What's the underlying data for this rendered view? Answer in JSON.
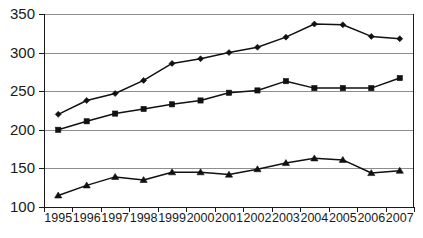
{
  "chart_data": {
    "type": "line",
    "title": "",
    "subtitle": "",
    "xlabel": "",
    "ylabel": "",
    "categories": [
      "1995",
      "1996",
      "1997",
      "1998",
      "1999",
      "2000",
      "2001",
      "2002",
      "2003",
      "2004",
      "2005",
      "2006",
      "2007"
    ],
    "x": [
      1995,
      1996,
      1997,
      1998,
      1999,
      2000,
      2001,
      2002,
      2003,
      2004,
      2005,
      2006,
      2007
    ],
    "ylim": [
      100,
      350
    ],
    "yticks": [
      100,
      150,
      200,
      250,
      300,
      350
    ],
    "ytick_labels": [
      "100",
      "150",
      "200",
      "250",
      "300",
      "350"
    ],
    "grid": true,
    "grid_axis": "y",
    "legend": false,
    "legend_position": "none",
    "series": [
      {
        "name": "series-1",
        "marker": "diamond",
        "color": "#111111",
        "values": [
          220,
          238,
          247,
          264,
          286,
          292,
          300,
          307,
          320,
          337,
          336,
          321,
          318
        ]
      },
      {
        "name": "series-2",
        "marker": "square",
        "color": "#111111",
        "values": [
          200,
          211,
          221,
          227,
          233,
          238,
          248,
          251,
          263,
          254,
          254,
          254,
          267
        ]
      },
      {
        "name": "series-3",
        "marker": "triangle",
        "color": "#111111",
        "values": [
          115,
          128,
          139,
          135,
          145,
          145,
          142,
          149,
          157,
          163,
          161,
          144,
          147
        ]
      }
    ]
  },
  "style": {
    "background": "#ffffff",
    "grid_color": "#8d8d8d",
    "axis_color": "#1a1a1a",
    "line_color": "#111111",
    "text_color": "#1a1a1a"
  }
}
